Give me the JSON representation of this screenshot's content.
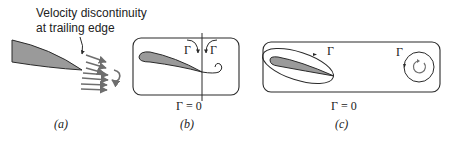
{
  "panels": [
    {
      "id": "a",
      "caption": "(a)",
      "annotation_line1": "Velocity discontinuity",
      "annotation_line2": "at trailing edge"
    },
    {
      "id": "b",
      "caption": "(b)",
      "circulation_left_label": "Γ",
      "circulation_right_label": "Γ",
      "total_circulation_label": "Γ = 0"
    },
    {
      "id": "c",
      "caption": "(c)",
      "airfoil_circulation_label": "Γ",
      "vortex_circulation_label": "Γ",
      "total_circulation_label": "Γ = 0"
    }
  ],
  "colors": {
    "ink": "#2a2a2a",
    "airfoil_fill": "#9a9a9a",
    "velocity_vectors": "#6e6e6e"
  }
}
